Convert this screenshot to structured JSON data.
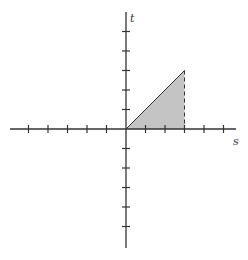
{
  "diagram": {
    "axes": {
      "horizontal_label": "s",
      "vertical_label": "t",
      "tick_spacing_units": 1,
      "s_ticks": [
        -5,
        -4,
        -3,
        -2,
        -1,
        1,
        2,
        3,
        4,
        5
      ],
      "t_ticks": [
        -5,
        -4,
        -3,
        -2,
        -1,
        1,
        2,
        3,
        4,
        5
      ]
    },
    "shaded_region": {
      "shape": "triangle",
      "vertices": [
        [
          0,
          0
        ],
        [
          3,
          3
        ],
        [
          3,
          0
        ]
      ],
      "fill_color": "#c4c4c4",
      "right_edge_style": "dashed"
    },
    "colors": {
      "axis": "#333333",
      "fill": "#c4c4c4"
    }
  }
}
